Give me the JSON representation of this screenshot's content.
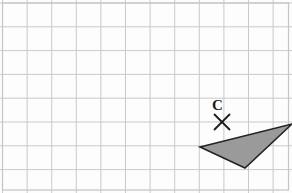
{
  "figure": {
    "kind": "geometry-grid-worksheet",
    "canvas": {
      "width": 292,
      "height": 193,
      "background": "#fdfdfd"
    },
    "grid": {
      "line_color": "#c9c9cf",
      "border_color": "#c4c4ca",
      "cell_width": 24.6,
      "cell_height": 23.8,
      "origin_x": 2.5,
      "origin_y": 3.0,
      "columns": 12,
      "rows": 8,
      "show_border": true
    },
    "shapes": [
      {
        "name": "shaded-triangle",
        "type": "polygon",
        "points": "200,147 292,124 245,168",
        "fill": "#9a9a9a",
        "stroke": "#232323",
        "stroke_width": 1.6
      }
    ],
    "markers": [
      {
        "name": "centre-of-rotation",
        "type": "cross",
        "label": "C",
        "x": 222,
        "y": 122,
        "arm": 8,
        "stroke": "#1a1a1a",
        "stroke_width": 1.8,
        "label_x": 212,
        "label_y": 98
      }
    ]
  }
}
